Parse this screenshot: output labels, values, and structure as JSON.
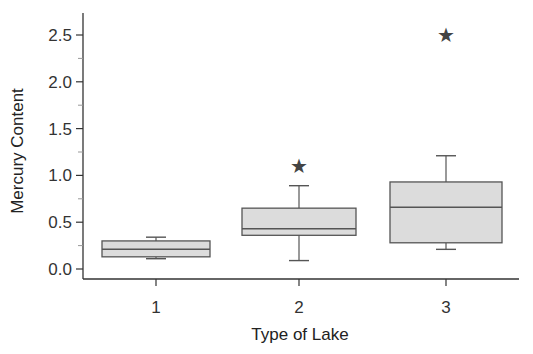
{
  "chart_data": {
    "type": "boxplot",
    "title": "",
    "xlabel": "Type of Lake",
    "ylabel": "Mercury Content",
    "categories": [
      "1",
      "2",
      "3"
    ],
    "ylim": [
      -0.1,
      2.75
    ],
    "yticks": [
      "0.0",
      "0.5",
      "1.0",
      "1.5",
      "2.0",
      "2.5"
    ],
    "ytick_values": [
      0.0,
      0.5,
      1.0,
      1.5,
      2.0,
      2.5
    ],
    "grid": false,
    "legend": null,
    "series": [
      {
        "name": "1",
        "whisker_low": 0.11,
        "q1": 0.13,
        "median": 0.21,
        "q3": 0.3,
        "whisker_high": 0.34,
        "outliers": []
      },
      {
        "name": "2",
        "whisker_low": 0.09,
        "q1": 0.36,
        "median": 0.43,
        "q3": 0.65,
        "whisker_high": 0.89,
        "outliers": [
          1.1
        ]
      },
      {
        "name": "3",
        "whisker_low": 0.21,
        "q1": 0.28,
        "median": 0.66,
        "q3": 0.93,
        "whisker_high": 1.21,
        "outliers": [
          2.5
        ]
      }
    ],
    "colors": {
      "box_fill": "#dcdcdc",
      "box_stroke": "#555555",
      "axis": "#333333",
      "outlier": "#444444"
    }
  }
}
